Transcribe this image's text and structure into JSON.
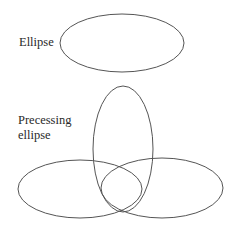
{
  "labels": {
    "ellipse": "Ellipse",
    "precessing_line1": "Precessing",
    "precessing_line2": "ellipse"
  },
  "style": {
    "stroke_color": "#555555",
    "text_color": "#2a2a2a"
  },
  "shapes": [
    {
      "name": "single-ellipse",
      "cx": 122,
      "cy": 43,
      "rx": 62,
      "ry": 29
    },
    {
      "name": "precessing-ellipse-vertical",
      "cx": 123,
      "cy": 149,
      "rx": 30,
      "ry": 63
    },
    {
      "name": "precessing-ellipse-left",
      "cx": 80,
      "cy": 189,
      "rx": 62,
      "ry": 29
    },
    {
      "name": "precessing-ellipse-right",
      "cx": 162,
      "cy": 188,
      "rx": 61,
      "ry": 30
    }
  ]
}
